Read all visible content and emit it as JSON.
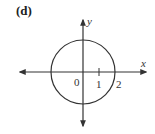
{
  "figure": {
    "panel_label": "(d)",
    "axes": {
      "x_label": "x",
      "y_label": "y",
      "origin_label": "0",
      "tick_labels": [
        "1",
        "2"
      ]
    },
    "shape": {
      "type": "circle",
      "center": [
        0,
        0
      ],
      "radius": 2
    },
    "colors": {
      "stroke": "#333333",
      "background": "#ffffff"
    }
  }
}
